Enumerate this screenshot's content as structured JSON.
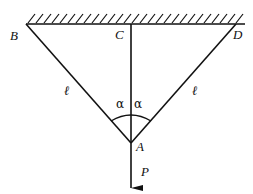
{
  "diagram": {
    "type": "two-rope suspension with central rod",
    "labels": {
      "B": "B",
      "C": "C",
      "D": "D",
      "A": "A",
      "P": "P",
      "left_length": "ℓ",
      "right_length": "ℓ",
      "left_angle": "α",
      "right_angle": "α"
    },
    "colors": {
      "stroke": "#111111",
      "background": "#ffffff"
    }
  }
}
